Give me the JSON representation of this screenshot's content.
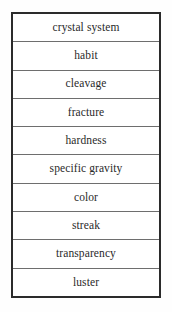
{
  "table": {
    "title": "Mineral Properties",
    "border_color": "#2b2b2b",
    "separator_color": "#6e6e6e",
    "background_color": "#ffffff",
    "text_color": "#2a2a2a",
    "row_count": 10,
    "column_count": 1,
    "rows": [
      {
        "label": "crystal system"
      },
      {
        "label": "habit"
      },
      {
        "label": "cleavage"
      },
      {
        "label": "fracture"
      },
      {
        "label": "hardness"
      },
      {
        "label": "specific gravity"
      },
      {
        "label": "color"
      },
      {
        "label": "streak"
      },
      {
        "label": "transparency"
      },
      {
        "label": "luster"
      }
    ]
  }
}
